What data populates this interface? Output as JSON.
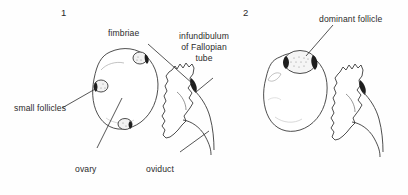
{
  "figure": {
    "background_color": "#fefefe",
    "ink_color": "#2b2b2b",
    "width": 408,
    "height": 195
  },
  "panels": [
    {
      "number": "1",
      "description": "Ovary bearing several small follicles, shown beside the infundibulum of the Fallopian tube and oviduct"
    },
    {
      "number": "2",
      "description": "Ovary bearing a single large dominant follicle, shown beside the oviduct"
    }
  ],
  "labels": {
    "small_follicles": "small follicles",
    "fimbriae": "fimbriae",
    "infundibulum_line1": "infundibulum",
    "infundibulum_line2": "of Fallopian",
    "infundibulum_line3": "tube",
    "ovary": "ovary",
    "oviduct": "oviduct",
    "dominant_follicle": "dominant follicle"
  }
}
